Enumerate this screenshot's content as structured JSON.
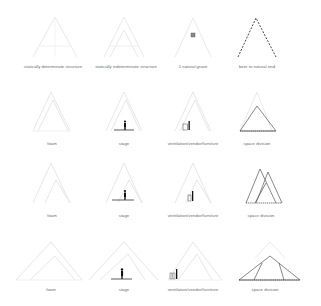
{
  "colors": {
    "faint": "#e4e4e4",
    "mid": "#c8c8c8",
    "dark": "#555555",
    "ink": "#222222",
    "label": "#6a6a6a"
  },
  "rows": [
    {
      "cells": [
        {
          "label": "statically determinate structure"
        },
        {
          "label": "statically indeterminate structure"
        },
        {
          "label": "1 natural grave"
        },
        {
          "label": "beer to natural end"
        }
      ]
    },
    {
      "cells": [
        {
          "label": "foam"
        },
        {
          "label": "stage"
        },
        {
          "label": "ventilation/vendor/furniture"
        },
        {
          "label": "space division"
        }
      ]
    },
    {
      "cells": [
        {
          "label": "foam"
        },
        {
          "label": "stage"
        },
        {
          "label": "ventilation/vendor/furniture"
        },
        {
          "label": "space division"
        }
      ]
    },
    {
      "cells": [
        {
          "label": "foam"
        },
        {
          "label": "stage"
        },
        {
          "label": "ventilation/vendor/furniture"
        },
        {
          "label": "space division"
        }
      ]
    }
  ]
}
